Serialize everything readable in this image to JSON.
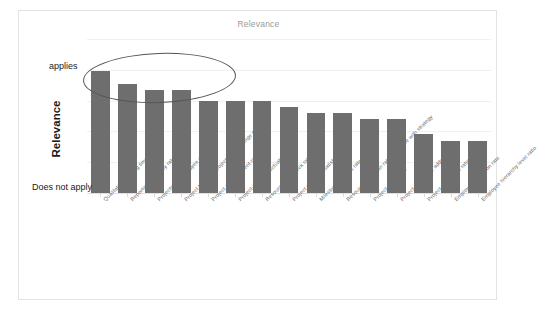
{
  "chart": {
    "title": "Relevance",
    "axis_title_y": "Relevance",
    "y_top_label": "applies",
    "y_bottom_label": "Does not apply",
    "bar_color": "#6e6e6e",
    "annotation": {
      "shape": "ellipse",
      "color": "#555555",
      "covers_bars": 4
    }
  },
  "chart_data": {
    "type": "bar",
    "title": "Relevance",
    "xlabel": "",
    "ylabel": "Relevance",
    "ylim": [
      0,
      100
    ],
    "grid": true,
    "legend": "none",
    "y_axis_tick_labels": [
      "Does not apply",
      "applies"
    ],
    "categories": [
      "Qualitative meeting time rate",
      "Reporting efficiency rate",
      "Projects per employee ratio",
      "Project target or project order change rate",
      "Project abandonment ratio",
      "Project-specific fluctuation ratio",
      "Resource bottleneck rate",
      "Project customer satisfaction",
      "Milestone success rate",
      "Resource utilization rate not in line with strategy",
      "Project effort ratio",
      "Project time value added ratio",
      "Project travel time ratio",
      "Employee utilization rate",
      "Employee hierarchy level ratio"
    ],
    "values": [
      79,
      71,
      67,
      67,
      60,
      60,
      60,
      56,
      52,
      52,
      48,
      48,
      38,
      34,
      34
    ]
  }
}
